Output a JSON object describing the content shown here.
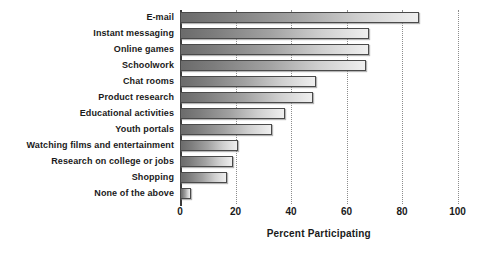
{
  "chart_data": {
    "type": "bar",
    "orientation": "horizontal",
    "title": "",
    "xlabel": "Percent Participating",
    "ylabel": "",
    "xlim": [
      0,
      100
    ],
    "xticks": [
      0,
      20,
      40,
      60,
      80,
      100
    ],
    "grid": true,
    "legend": false,
    "categories": [
      "E-mail",
      "Instant messaging",
      "Online games",
      "Schoolwork",
      "Chat rooms",
      "Product research",
      "Educational activities",
      "Youth portals",
      "Watching films and entertainment",
      "Research on college or jobs",
      "Shopping",
      "None of the above"
    ],
    "values": [
      86,
      68,
      68,
      67,
      49,
      48,
      38,
      33,
      21,
      19,
      17,
      4
    ],
    "bar_gradient_from": "#6b6b6b",
    "bar_gradient_to": "#efefef",
    "axis_color": "#3b3b3b",
    "grid_color": "#8c8c8c"
  }
}
